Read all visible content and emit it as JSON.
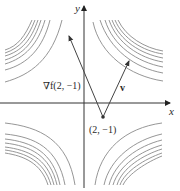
{
  "figure": {
    "type": "contour-plot-with-vectors",
    "axes": {
      "x_label": "x",
      "y_label": "y"
    },
    "point": {
      "label": "(2, −1)",
      "coords": [
        2,
        -1
      ]
    },
    "vectors": [
      {
        "name": "gradient",
        "label": "∇f(2, −1)",
        "direction": "up-left"
      },
      {
        "name": "v",
        "label": "v",
        "direction": "up-right"
      }
    ],
    "contours": {
      "quadrants": [
        "upper-left",
        "upper-right",
        "lower-left",
        "lower-right"
      ],
      "curves_per_quadrant": 7,
      "shape": "hyperbola"
    }
  }
}
